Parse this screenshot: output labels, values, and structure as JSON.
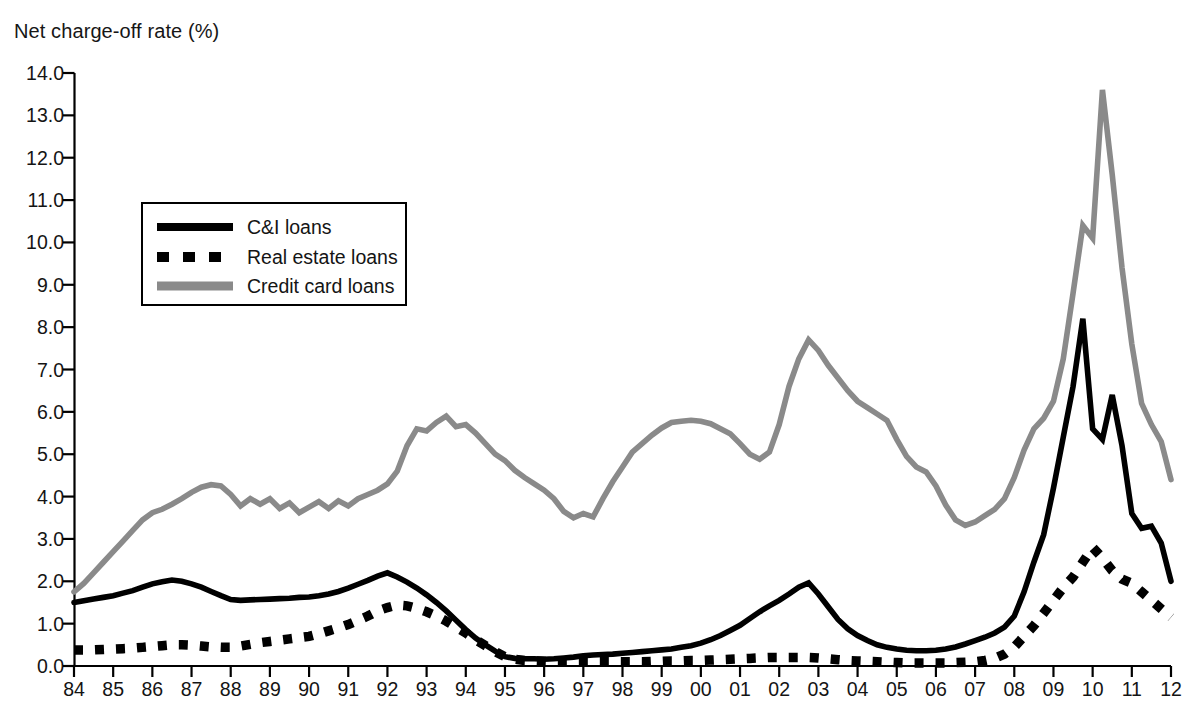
{
  "chart_data": {
    "type": "line",
    "title": "Net charge-off rate (%)",
    "xlabel": "",
    "ylabel": "Net charge-off rate (%)",
    "ylim": [
      0.0,
      14.0
    ],
    "ytick_step": 1.0,
    "yticks": [
      "0.0",
      "1.0",
      "2.0",
      "3.0",
      "4.0",
      "5.0",
      "6.0",
      "7.0",
      "8.0",
      "9.0",
      "10.0",
      "11.0",
      "12.0",
      "13.0",
      "14.0"
    ],
    "xlim": [
      1984.0,
      2012.0
    ],
    "xticks": [
      "84",
      "85",
      "86",
      "87",
      "88",
      "89",
      "90",
      "91",
      "92",
      "93",
      "94",
      "95",
      "96",
      "97",
      "98",
      "99",
      "00",
      "01",
      "02",
      "03",
      "04",
      "05",
      "06",
      "07",
      "08",
      "09",
      "10",
      "11",
      "12"
    ],
    "grid": false,
    "legend_position": "upper-left-inside",
    "frequency": "quarterly",
    "series": [
      {
        "name": "C&I loans",
        "color": "#000000",
        "style": "solid",
        "x": [
          1984.0,
          1984.25,
          1984.5,
          1984.75,
          1985.0,
          1985.25,
          1985.5,
          1985.75,
          1986.0,
          1986.25,
          1986.5,
          1986.75,
          1987.0,
          1987.25,
          1987.5,
          1987.75,
          1988.0,
          1988.25,
          1988.5,
          1988.75,
          1989.0,
          1989.25,
          1989.5,
          1989.75,
          1990.0,
          1990.25,
          1990.5,
          1990.75,
          1991.0,
          1991.25,
          1991.5,
          1991.75,
          1992.0,
          1992.25,
          1992.5,
          1992.75,
          1993.0,
          1993.25,
          1993.5,
          1993.75,
          1994.0,
          1994.25,
          1994.5,
          1994.75,
          1995.0,
          1995.25,
          1995.5,
          1995.75,
          1996.0,
          1996.25,
          1996.5,
          1996.75,
          1997.0,
          1997.25,
          1997.5,
          1997.75,
          1998.0,
          1998.25,
          1998.5,
          1998.75,
          1999.0,
          1999.25,
          1999.5,
          1999.75,
          2000.0,
          2000.25,
          2000.5,
          2000.75,
          2001.0,
          2001.25,
          2001.5,
          2001.75,
          2002.0,
          2002.25,
          2002.5,
          2002.75,
          2003.0,
          2003.25,
          2003.5,
          2003.75,
          2004.0,
          2004.25,
          2004.5,
          2004.75,
          2005.0,
          2005.25,
          2005.5,
          2005.75,
          2006.0,
          2006.25,
          2006.5,
          2006.75,
          2007.0,
          2007.25,
          2007.5,
          2007.75,
          2008.0,
          2008.25,
          2008.5,
          2008.75,
          2009.0,
          2009.25,
          2009.5,
          2009.75,
          2010.0,
          2010.25,
          2010.5,
          2010.75,
          2011.0,
          2011.25,
          2011.5,
          2011.75,
          2012.0
        ],
        "y": [
          1.5,
          1.54,
          1.58,
          1.62,
          1.66,
          1.72,
          1.78,
          1.86,
          1.94,
          1.99,
          2.03,
          2.0,
          1.94,
          1.86,
          1.76,
          1.66,
          1.57,
          1.55,
          1.56,
          1.57,
          1.58,
          1.59,
          1.6,
          1.62,
          1.63,
          1.66,
          1.7,
          1.76,
          1.84,
          1.93,
          2.02,
          2.12,
          2.2,
          2.1,
          1.98,
          1.84,
          1.68,
          1.5,
          1.3,
          1.08,
          0.86,
          0.66,
          0.5,
          0.35,
          0.22,
          0.18,
          0.17,
          0.17,
          0.16,
          0.17,
          0.19,
          0.21,
          0.24,
          0.26,
          0.27,
          0.28,
          0.3,
          0.32,
          0.34,
          0.36,
          0.38,
          0.4,
          0.44,
          0.48,
          0.54,
          0.62,
          0.72,
          0.84,
          0.96,
          1.12,
          1.28,
          1.42,
          1.55,
          1.7,
          1.86,
          1.96,
          1.7,
          1.4,
          1.1,
          0.88,
          0.72,
          0.6,
          0.5,
          0.44,
          0.4,
          0.37,
          0.36,
          0.36,
          0.37,
          0.4,
          0.45,
          0.52,
          0.6,
          0.68,
          0.78,
          0.92,
          1.18,
          1.75,
          2.45,
          3.1,
          4.2,
          5.4,
          6.6,
          8.2,
          5.6,
          5.35,
          6.4,
          5.2,
          3.6,
          3.25,
          3.3,
          2.9,
          2.0
        ]
      },
      {
        "name": "Real estate loans",
        "color": "#000000",
        "style": "dashed",
        "x": [
          1984.0,
          1984.25,
          1984.5,
          1984.75,
          1985.0,
          1985.25,
          1985.5,
          1985.75,
          1986.0,
          1986.25,
          1986.5,
          1986.75,
          1987.0,
          1987.25,
          1987.5,
          1987.75,
          1988.0,
          1988.25,
          1988.5,
          1988.75,
          1989.0,
          1989.25,
          1989.5,
          1989.75,
          1990.0,
          1990.25,
          1990.5,
          1990.75,
          1991.0,
          1991.25,
          1991.5,
          1991.75,
          1992.0,
          1992.25,
          1992.5,
          1992.75,
          1993.0,
          1993.25,
          1993.5,
          1993.75,
          1994.0,
          1994.25,
          1994.5,
          1994.75,
          1995.0,
          1995.25,
          1995.5,
          1995.75,
          1996.0,
          1996.25,
          1996.5,
          1996.75,
          1997.0,
          1997.25,
          1997.5,
          1997.75,
          1998.0,
          1998.25,
          1998.5,
          1998.75,
          1999.0,
          1999.25,
          1999.5,
          1999.75,
          2000.0,
          2000.25,
          2000.5,
          2000.75,
          2001.0,
          2001.25,
          2001.5,
          2001.75,
          2002.0,
          2002.25,
          2002.5,
          2002.75,
          2003.0,
          2003.25,
          2003.5,
          2003.75,
          2004.0,
          2004.25,
          2004.5,
          2004.75,
          2005.0,
          2005.25,
          2005.5,
          2005.75,
          2006.0,
          2006.25,
          2006.5,
          2006.75,
          2007.0,
          2007.25,
          2007.5,
          2007.75,
          2008.0,
          2008.25,
          2008.5,
          2008.75,
          2009.0,
          2009.25,
          2009.5,
          2009.75,
          2010.0,
          2010.25,
          2010.5,
          2010.75,
          2011.0,
          2011.25,
          2011.5,
          2011.75,
          2012.0
        ],
        "y": [
          0.38,
          0.38,
          0.38,
          0.39,
          0.4,
          0.41,
          0.42,
          0.44,
          0.46,
          0.48,
          0.5,
          0.5,
          0.49,
          0.47,
          0.45,
          0.44,
          0.44,
          0.47,
          0.51,
          0.55,
          0.58,
          0.61,
          0.64,
          0.67,
          0.7,
          0.76,
          0.83,
          0.9,
          0.98,
          1.08,
          1.18,
          1.3,
          1.38,
          1.44,
          1.42,
          1.36,
          1.28,
          1.18,
          1.06,
          0.92,
          0.78,
          0.62,
          0.48,
          0.34,
          0.22,
          0.16,
          0.13,
          0.12,
          0.11,
          0.1,
          0.1,
          0.1,
          0.1,
          0.1,
          0.1,
          0.1,
          0.1,
          0.1,
          0.1,
          0.11,
          0.11,
          0.12,
          0.12,
          0.13,
          0.13,
          0.14,
          0.15,
          0.16,
          0.17,
          0.18,
          0.19,
          0.2,
          0.2,
          0.2,
          0.2,
          0.2,
          0.19,
          0.17,
          0.15,
          0.13,
          0.12,
          0.11,
          0.1,
          0.09,
          0.08,
          0.07,
          0.07,
          0.07,
          0.07,
          0.07,
          0.08,
          0.09,
          0.1,
          0.13,
          0.18,
          0.28,
          0.45,
          0.7,
          0.95,
          1.25,
          1.55,
          1.85,
          2.1,
          2.45,
          2.8,
          2.55,
          2.25,
          2.05,
          1.95,
          1.75,
          1.55,
          1.35,
          1.15
        ]
      },
      {
        "name": "Credit card loans",
        "color": "#8a8a8a",
        "style": "solid",
        "x": [
          1984.0,
          1984.25,
          1984.5,
          1984.75,
          1985.0,
          1985.25,
          1985.5,
          1985.75,
          1986.0,
          1986.25,
          1986.5,
          1986.75,
          1987.0,
          1987.25,
          1987.5,
          1987.75,
          1988.0,
          1988.25,
          1988.5,
          1988.75,
          1989.0,
          1989.25,
          1989.5,
          1989.75,
          1990.0,
          1990.25,
          1990.5,
          1990.75,
          1991.0,
          1991.25,
          1991.5,
          1991.75,
          1992.0,
          1992.25,
          1992.5,
          1992.75,
          1993.0,
          1993.25,
          1993.5,
          1993.75,
          1994.0,
          1994.25,
          1994.5,
          1994.75,
          1995.0,
          1995.25,
          1995.5,
          1995.75,
          1996.0,
          1996.25,
          1996.5,
          1996.75,
          1997.0,
          1997.25,
          1997.5,
          1997.75,
          1998.0,
          1998.25,
          1998.5,
          1998.75,
          1999.0,
          1999.25,
          1999.5,
          1999.75,
          2000.0,
          2000.25,
          2000.5,
          2000.75,
          2001.0,
          2001.25,
          2001.5,
          2001.75,
          2002.0,
          2002.25,
          2002.5,
          2002.75,
          2003.0,
          2003.25,
          2003.5,
          2003.75,
          2004.0,
          2004.25,
          2004.5,
          2004.75,
          2005.0,
          2005.25,
          2005.5,
          2005.75,
          2006.0,
          2006.25,
          2006.5,
          2006.75,
          2007.0,
          2007.25,
          2007.5,
          2007.75,
          2008.0,
          2008.25,
          2008.5,
          2008.75,
          2009.0,
          2009.25,
          2009.5,
          2009.75,
          2010.0,
          2010.25,
          2010.5,
          2010.75,
          2011.0,
          2011.25,
          2011.5,
          2011.75,
          2012.0
        ],
        "y": [
          1.75,
          1.95,
          2.2,
          2.45,
          2.7,
          2.95,
          3.2,
          3.45,
          3.62,
          3.7,
          3.82,
          3.95,
          4.1,
          4.22,
          4.28,
          4.25,
          4.05,
          3.78,
          3.95,
          3.82,
          3.95,
          3.72,
          3.85,
          3.62,
          3.75,
          3.88,
          3.72,
          3.9,
          3.78,
          3.95,
          4.05,
          4.15,
          4.3,
          4.6,
          5.2,
          5.6,
          5.55,
          5.75,
          5.9,
          5.65,
          5.7,
          5.5,
          5.25,
          5.0,
          4.85,
          4.62,
          4.45,
          4.3,
          4.15,
          3.95,
          3.65,
          3.5,
          3.6,
          3.52,
          3.95,
          4.35,
          4.7,
          5.05,
          5.25,
          5.45,
          5.62,
          5.75,
          5.78,
          5.8,
          5.78,
          5.72,
          5.6,
          5.48,
          5.25,
          5.0,
          4.88,
          5.05,
          5.7,
          6.6,
          7.25,
          7.7,
          7.45,
          7.1,
          6.8,
          6.5,
          6.25,
          6.1,
          5.95,
          5.8,
          5.35,
          4.95,
          4.7,
          4.58,
          4.25,
          3.8,
          3.45,
          3.32,
          3.4,
          3.55,
          3.7,
          3.95,
          4.45,
          5.1,
          5.6,
          5.85,
          6.25,
          7.25,
          8.8,
          10.4,
          10.1,
          13.6,
          11.6,
          9.4,
          7.6,
          6.2,
          5.7,
          5.3,
          4.4
        ]
      }
    ]
  },
  "legend": {
    "items": [
      {
        "label": "C&I loans",
        "style": "solid-black"
      },
      {
        "label": "Real estate loans",
        "style": "dashed-black"
      },
      {
        "label": "Credit card loans",
        "style": "solid-gray"
      }
    ]
  }
}
